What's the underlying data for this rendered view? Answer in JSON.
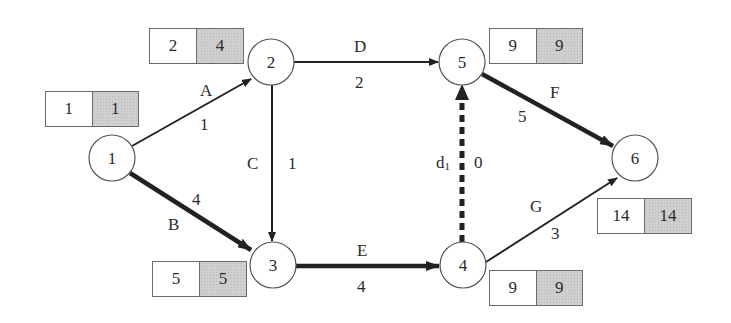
{
  "diagram": {
    "type": "activity-on-arrow network diagram",
    "colors": {
      "line": "#222222",
      "node_border": "#555555",
      "latest_cell": "#cfcfcf"
    },
    "nodes": [
      {
        "id": "1",
        "label": "1",
        "earliest": "1",
        "latest": "1"
      },
      {
        "id": "2",
        "label": "2",
        "earliest": "2",
        "latest": "4"
      },
      {
        "id": "3",
        "label": "3",
        "earliest": "5",
        "latest": "5"
      },
      {
        "id": "4",
        "label": "4",
        "earliest": "9",
        "latest": "9"
      },
      {
        "id": "5",
        "label": "5",
        "earliest": "9",
        "latest": "9"
      },
      {
        "id": "6",
        "label": "6",
        "earliest": "14",
        "latest": "14"
      }
    ],
    "edges": [
      {
        "from": "1",
        "to": "2",
        "name": "A",
        "duration": "1",
        "critical": false,
        "dummy": false
      },
      {
        "from": "1",
        "to": "3",
        "name": "B",
        "duration": "4",
        "critical": true,
        "dummy": false
      },
      {
        "from": "2",
        "to": "3",
        "name": "C",
        "duration": "1",
        "critical": false,
        "dummy": false
      },
      {
        "from": "2",
        "to": "5",
        "name": "D",
        "duration": "2",
        "critical": false,
        "dummy": false
      },
      {
        "from": "3",
        "to": "4",
        "name": "E",
        "duration": "4",
        "critical": true,
        "dummy": false
      },
      {
        "from": "5",
        "to": "6",
        "name": "F",
        "duration": "5",
        "critical": true,
        "dummy": false
      },
      {
        "from": "4",
        "to": "6",
        "name": "G",
        "duration": "3",
        "critical": false,
        "dummy": false
      },
      {
        "from": "4",
        "to": "5",
        "name": "d",
        "subscript": "1",
        "duration": "0",
        "critical": true,
        "dummy": true
      }
    ]
  }
}
